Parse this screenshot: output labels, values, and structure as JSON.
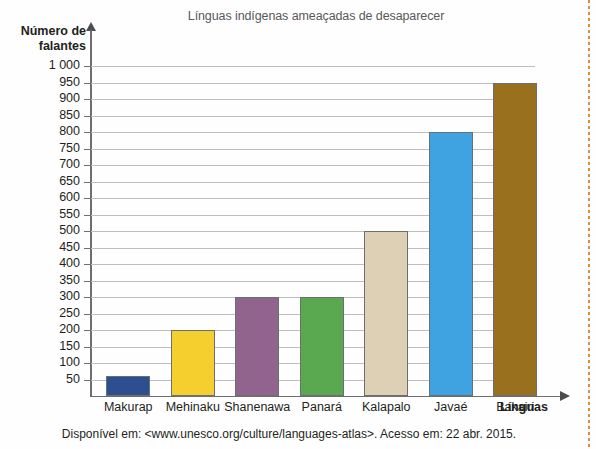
{
  "chart_data": {
    "type": "bar",
    "title": "Línguas indígenas ameaçadas de desaparecer",
    "xlabel": "Línguas",
    "ylabel": "Número de falantes",
    "categories": [
      "Makurap",
      "Mehinaku",
      "Shanenawa",
      "Panará",
      "Kalapalo",
      "Javaé",
      "Bakairi"
    ],
    "values": [
      60,
      200,
      300,
      300,
      500,
      800,
      950
    ],
    "colors": [
      "#2e4f8f",
      "#f5cf2e",
      "#90648c",
      "#5aa84f",
      "#ded0b4",
      "#3ea3e0",
      "#99701d"
    ],
    "ylim": [
      0,
      1000
    ],
    "yticks": [
      "1 000",
      "950",
      "900",
      "850",
      "800",
      "750",
      "700",
      "650",
      "600",
      "550",
      "500",
      "450",
      "400",
      "350",
      "300",
      "250",
      "200",
      "150",
      "100",
      "50"
    ],
    "ytick_values": [
      1000,
      950,
      900,
      850,
      800,
      750,
      700,
      650,
      600,
      550,
      500,
      450,
      400,
      350,
      300,
      250,
      200,
      150,
      100,
      50
    ],
    "grid": true,
    "legend": "none"
  },
  "source": {
    "note": "Disponível em: <www.unesco.org/culture/languages-atlas>. Acesso em: 22 abr. 2015."
  },
  "axis_caption": {
    "y_line1": "Número de",
    "y_line2": "falantes"
  }
}
